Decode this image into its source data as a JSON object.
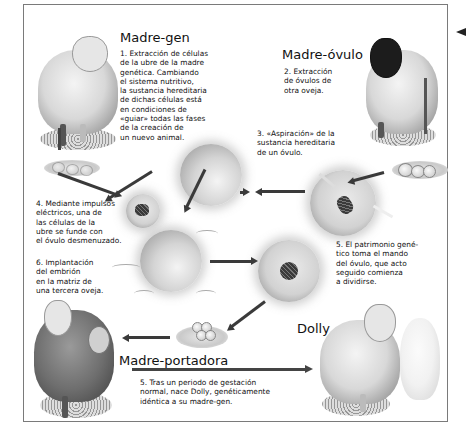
{
  "diagram": {
    "sections": {
      "madre_gen": {
        "title": "Madre-gen",
        "step": "1. Extracción de células\nde la ubre de la madre\ngenética. Cambiando\nel sistema nutritivo,\nla sustancia hereditaria\nde dichas células está\nen condiciones de\n«guiar» todas las fases\nde la creación de\nun nuevo animal."
      },
      "madre_ovulo": {
        "title": "Madre-óvulo",
        "step": "2. Extracción\nde óvulos de\notra oveja."
      },
      "aspiracion": {
        "step": "3. «Aspiración» de la\nsustancia hereditaria\nde un óvulo."
      },
      "fusion": {
        "step": "4. Mediante impulsos\neléctricos, una de\nlas células de la\nubre se funde con\nel óvulo desmenuzado."
      },
      "patrimonio": {
        "step": "5. El patrimonio gené-\ntico toma el mando\ndel óvulo, que acto\nseguido comienza\na dividirse."
      },
      "implantacion": {
        "step": "6. Implantación\ndel embrión\nen la matriz de\nuna tercera oveja."
      },
      "madre_portadora": {
        "title": "Madre-portadora",
        "step": "5. Tras un periodo de gestación\nnormal, nace Dolly, genéticamente\nidéntica a su madre-gen."
      },
      "dolly": {
        "title": "Dolly"
      }
    },
    "icons": {
      "sheep_gen": "white-sheep-icon",
      "sheep_ovulo": "black-faced-sheep-icon",
      "sheep_portadora": "dark-pregnant-sheep-icon",
      "sheep_dolly": "dolly-sheep-icon",
      "cell": "cell-icon",
      "arrow": "arrow-icon"
    },
    "colors": {
      "text": "#111111",
      "frame": "#7a7a7a",
      "arrow": "#3a3a3a"
    }
  }
}
